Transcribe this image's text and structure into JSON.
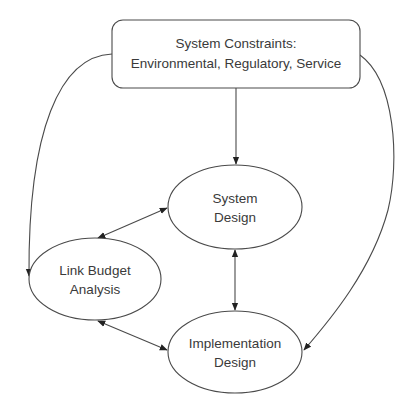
{
  "diagram": {
    "type": "flow",
    "nodes": [
      {
        "id": "constraints",
        "shape": "rounded-rect",
        "lines": [
          "System Constraints:",
          "Environmental, Regulatory, Service"
        ]
      },
      {
        "id": "system_design",
        "shape": "ellipse",
        "lines": [
          "System",
          "Design"
        ]
      },
      {
        "id": "link_budget",
        "shape": "ellipse",
        "lines": [
          "Link Budget",
          "Analysis"
        ]
      },
      {
        "id": "implementation_design",
        "shape": "ellipse",
        "lines": [
          "Implementation",
          "Design"
        ]
      }
    ],
    "edges": [
      {
        "from": "constraints",
        "to": "system_design",
        "direction": "forward"
      },
      {
        "from": "constraints",
        "to": "link_budget",
        "direction": "forward",
        "style": "curved"
      },
      {
        "from": "constraints",
        "to": "implementation_design",
        "direction": "forward",
        "style": "curved"
      },
      {
        "from": "system_design",
        "to": "link_budget",
        "direction": "both"
      },
      {
        "from": "system_design",
        "to": "implementation_design",
        "direction": "both"
      },
      {
        "from": "link_budget",
        "to": "implementation_design",
        "direction": "both"
      }
    ],
    "colors": {
      "stroke": "#4a4a4a",
      "text": "#3a3a3a",
      "background": "#ffffff"
    }
  }
}
